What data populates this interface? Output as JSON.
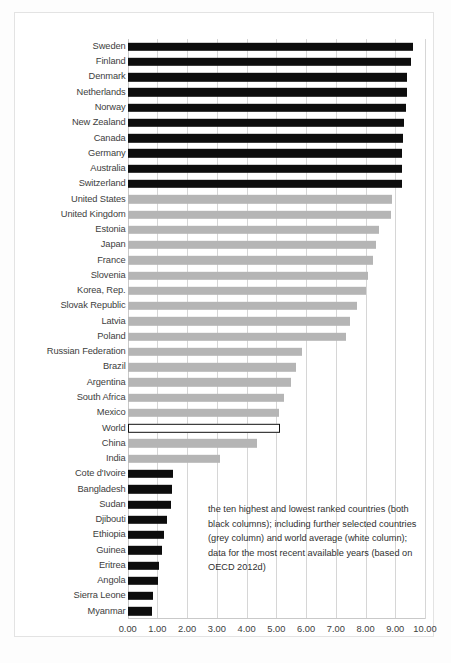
{
  "chart_data": {
    "type": "bar",
    "orientation": "horizontal",
    "title": "",
    "xlabel": "",
    "ylabel": "",
    "xlim": [
      0,
      10
    ],
    "grid": true,
    "legend_position": "inside-lower-right",
    "tick_labels": [
      "0.00",
      "1.00",
      "2.00",
      "3.00",
      "4.00",
      "5.00",
      "6.00",
      "7.00",
      "8.00",
      "9.00",
      "10.00"
    ],
    "ticks": [
      0,
      1,
      2,
      3,
      4,
      5,
      6,
      7,
      8,
      9,
      10
    ],
    "annotation": "the ten highest and lowest ranked countries (both black columns); including further selected countries (grey column) and world average (white column); data for the most recent available years (based on OECD 2012d)",
    "series_colors": {
      "black": "#0d0d0d",
      "grey": "#b5b5b5",
      "white": "#ffffff"
    },
    "categories": [
      "Sweden",
      "Finland",
      "Denmark",
      "Netherlands",
      "Norway",
      "New Zealand",
      "Canada",
      "Germany",
      "Australia",
      "Switzerland",
      "United States",
      "United Kingdom",
      "Estonia",
      "Japan",
      "France",
      "Slovenia",
      "Korea, Rep.",
      "Slovak Republic",
      "Latvia",
      "Poland",
      "Russian Federation",
      "Brazil",
      "Argentina",
      "South Africa",
      "Mexico",
      "World",
      "China",
      "India",
      "Cote d'Ivoire",
      "Bangladesh",
      "Sudan",
      "Djibouti",
      "Ethiopia",
      "Guinea",
      "Eritrea",
      "Angola",
      "Sierra Leone",
      "Myanmar"
    ],
    "values": [
      9.6,
      9.53,
      9.41,
      9.39,
      9.37,
      9.28,
      9.26,
      9.24,
      9.23,
      9.22,
      8.89,
      8.85,
      8.46,
      8.35,
      8.24,
      8.08,
      8.01,
      7.71,
      7.48,
      7.34,
      5.86,
      5.66,
      5.48,
      5.26,
      5.1,
      5.13,
      4.36,
      3.11,
      1.54,
      1.48,
      1.46,
      1.31,
      1.23,
      1.15,
      1.05,
      1.01,
      0.86,
      0.83
    ],
    "bar_styles": [
      "black",
      "black",
      "black",
      "black",
      "black",
      "black",
      "black",
      "black",
      "black",
      "black",
      "grey",
      "grey",
      "grey",
      "grey",
      "grey",
      "grey",
      "grey",
      "grey",
      "grey",
      "grey",
      "grey",
      "grey",
      "grey",
      "grey",
      "grey",
      "white",
      "grey",
      "grey",
      "black",
      "black",
      "black",
      "black",
      "black",
      "black",
      "black",
      "black",
      "black",
      "black"
    ]
  },
  "caption": ""
}
